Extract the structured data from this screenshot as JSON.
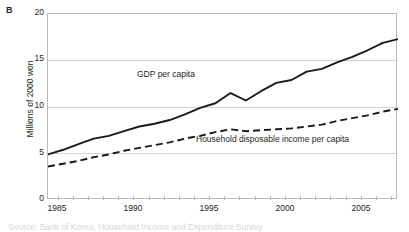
{
  "figure": {
    "panel_letter": "B",
    "caption_partial": "Source: Bank of Korea, Household Income and Expenditure Survey"
  },
  "chart_data": {
    "type": "line",
    "title": "",
    "xlabel": "",
    "ylabel": "Millions of 2000 won",
    "xlim": [
      1985,
      2008
    ],
    "ylim": [
      0,
      20
    ],
    "yticks": [
      0,
      5,
      10,
      15,
      20
    ],
    "xticks": [
      1985,
      1990,
      1995,
      2000,
      2005
    ],
    "xtick_labels": [
      "1985",
      "1990",
      "1995",
      "2000",
      "2005"
    ],
    "ytick_labels": [
      "0",
      "5",
      "10",
      "15",
      "20"
    ],
    "grid": "horizontal",
    "legend_position": "inline-annotation",
    "x": [
      1985,
      1986,
      1987,
      1988,
      1989,
      1990,
      1991,
      1992,
      1993,
      1994,
      1995,
      1996,
      1997,
      1998,
      1999,
      2000,
      2001,
      2002,
      2003,
      2004,
      2005,
      2006,
      2007,
      2008
    ],
    "series": [
      {
        "name": "GDP  per capita",
        "style": "solid",
        "color": "#1a1a1a",
        "values": [
          4.9,
          5.4,
          6.0,
          6.6,
          6.9,
          7.4,
          7.9,
          8.2,
          8.6,
          9.2,
          9.9,
          10.4,
          11.5,
          10.7,
          11.7,
          12.6,
          12.9,
          13.8,
          14.1,
          14.8,
          15.4,
          16.1,
          16.9,
          17.3
        ]
      },
      {
        "name": "Household disposable income per capita",
        "style": "dashed",
        "color": "#1a1a1a",
        "values": [
          3.6,
          3.9,
          4.2,
          4.6,
          4.9,
          5.3,
          5.6,
          5.9,
          6.2,
          6.6,
          6.9,
          7.3,
          7.6,
          7.4,
          7.5,
          7.6,
          7.7,
          7.9,
          8.1,
          8.5,
          8.8,
          9.1,
          9.5,
          9.8
        ]
      }
    ],
    "annotations": [
      {
        "text": "GDP  per capita",
        "x": 1992.5,
        "y": 13.0
      },
      {
        "text": "Household disposable income per capita",
        "x": 1997.5,
        "y": 6.0
      }
    ]
  }
}
